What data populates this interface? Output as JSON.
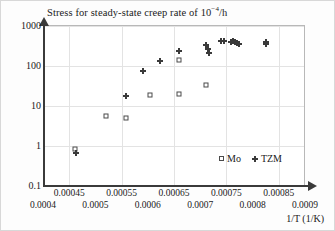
{
  "chart_data": {
    "type": "scatter",
    "title": "Stress for steady-state creep rate of 10−4/h",
    "title_prefix": "Stress for steady-state creep rate of 10",
    "title_exponent": "−4",
    "title_suffix": "/h",
    "xlabel": "1/T (1/K)",
    "ylabel": "",
    "xlim": [
      0.0004,
      0.0009
    ],
    "ylim": [
      0.1,
      1000
    ],
    "yscale": "log",
    "xscale": "linear",
    "grid": true,
    "legend_position": "lower-right",
    "y_ticks": [
      "1000",
      "100",
      "10",
      "1",
      "0.1"
    ],
    "y_tick_values": [
      1000,
      100,
      10,
      1,
      0.1
    ],
    "x_ticks_minor": [
      "0.00045",
      "0.00055",
      "0.00065",
      "0.00075",
      "0.00085"
    ],
    "x_tick_minor_values": [
      0.00045,
      0.00055,
      0.00065,
      0.00075,
      0.00085
    ],
    "x_ticks_major": [
      "0.0004",
      "0.0005",
      "0.0006",
      "0.0007",
      "0.0008",
      "0.0009"
    ],
    "x_tick_major_values": [
      0.0004,
      0.0005,
      0.0006,
      0.0007,
      0.0008,
      0.0009
    ],
    "series": [
      {
        "name": "Mo",
        "marker": "open-square",
        "color": "#4a4a4a",
        "points": [
          {
            "x": 0.000461,
            "y": 0.85
          },
          {
            "x": 0.000521,
            "y": 5.5
          },
          {
            "x": 0.000559,
            "y": 4.9
          },
          {
            "x": 0.000604,
            "y": 18.5
          },
          {
            "x": 0.000659,
            "y": 19.5
          },
          {
            "x": 0.000659,
            "y": 140
          },
          {
            "x": 0.000712,
            "y": 33
          }
        ]
      },
      {
        "name": "TZM",
        "marker": "diamond",
        "color": "#3a3a3a",
        "points": [
          {
            "x": 0.000463,
            "y": 0.66
          },
          {
            "x": 0.000558,
            "y": 18
          },
          {
            "x": 0.00059,
            "y": 75
          },
          {
            "x": 0.000624,
            "y": 130
          },
          {
            "x": 0.00066,
            "y": 235
          },
          {
            "x": 0.000711,
            "y": 340
          },
          {
            "x": 0.000714,
            "y": 260
          },
          {
            "x": 0.000716,
            "y": 210
          },
          {
            "x": 0.00074,
            "y": 410
          },
          {
            "x": 0.000746,
            "y": 420
          },
          {
            "x": 0.000758,
            "y": 400
          },
          {
            "x": 0.000763,
            "y": 420
          },
          {
            "x": 0.000766,
            "y": 390
          },
          {
            "x": 0.00077,
            "y": 370
          },
          {
            "x": 0.000774,
            "y": 360
          },
          {
            "x": 0.000825,
            "y": 400
          },
          {
            "x": 0.000826,
            "y": 350
          }
        ]
      }
    ]
  },
  "legend": {
    "items": [
      {
        "label": "Mo",
        "marker": "open-square"
      },
      {
        "label": "TZM",
        "marker": "diamond"
      }
    ]
  }
}
